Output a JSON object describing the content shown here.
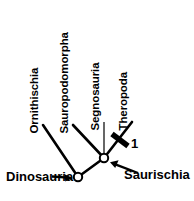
{
  "figure": {
    "type": "cladogram",
    "title": "",
    "width": 194,
    "height": 201,
    "background_color": "#ffffff",
    "line_color": "#000000"
  },
  "taxa": [
    {
      "name": "Ornithischia",
      "label": "Ornithischia",
      "orientation": "vertical",
      "tip_x": 43,
      "tip_y": 125,
      "label_x": 40,
      "label_y": 122
    },
    {
      "name": "Sauropodomorpha",
      "label": "Sauropodomorpha",
      "orientation": "vertical",
      "tip_x": 73,
      "tip_y": 125,
      "label_x": 70,
      "label_y": 122
    },
    {
      "name": "Segnosauria",
      "label": "Segnosauria",
      "orientation": "vertical",
      "tip_x": 104,
      "tip_y": 122,
      "label_x": 101,
      "label_y": 119
    },
    {
      "name": "Theropoda",
      "label": "Theropoda",
      "orientation": "vertical",
      "tip_x": 132,
      "tip_y": 122,
      "label_x": 129,
      "label_y": 119
    }
  ],
  "nodes": [
    {
      "name": "Dinosauria",
      "label": "Dinosauria",
      "x": 78,
      "y": 177,
      "marker": "open-circle",
      "label_x": 6,
      "label_y": 170,
      "arrow_from_x": 52,
      "arrow_from_y": 176,
      "arrow_to_x": 71,
      "arrow_to_y": 178
    },
    {
      "name": "Saurischia",
      "label": "Saurischia",
      "x": 104,
      "y": 158,
      "marker": "open-circle",
      "label_x": 124,
      "label_y": 168,
      "arrow_from_x": 138,
      "arrow_from_y": 173,
      "arrow_to_x": 111,
      "arrow_to_y": 163
    }
  ],
  "branch_marks": [
    {
      "name": "character-state-1",
      "label": "1",
      "on_branch": "Theropoda",
      "mark_x": 120,
      "mark_y": 140,
      "label_x": 131,
      "label_y": 137
    }
  ],
  "colors": {
    "stroke": "#000000",
    "fill": "#ffffff",
    "text": "#000000"
  }
}
